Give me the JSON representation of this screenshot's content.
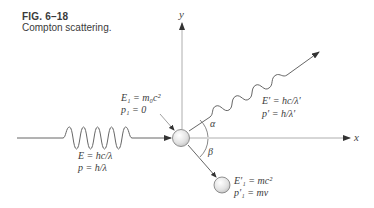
{
  "caption": {
    "figure_number": "FIG. 6–18",
    "title": "Compton scattering."
  },
  "axes": {
    "x_label": "x",
    "y_label": "y"
  },
  "incident_photon": {
    "energy": "E = hc/λ",
    "momentum": "p = h/λ"
  },
  "initial_electron": {
    "energy": "E₁ = m₀c²",
    "momentum": "p₁ = 0"
  },
  "scattered_photon": {
    "energy": "E′ = hc/λ′",
    "momentum": "p′ = h/λ′"
  },
  "recoil_electron": {
    "energy": "E′₁ = mc²",
    "momentum": "p′₁ = mv"
  },
  "angles": {
    "photon_angle": "α",
    "electron_angle": "β"
  },
  "colors": {
    "line": "#555555",
    "ball_fill": "#e6e6e6",
    "ball_stroke": "#777777",
    "text": "#3a3a3a"
  }
}
